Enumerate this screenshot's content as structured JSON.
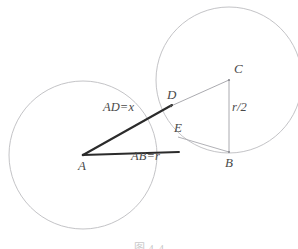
{
  "figure": {
    "caption": "图 4-4",
    "colors": {
      "circle_stroke": "#b9b9bd",
      "thin_line": "#9a9aa0",
      "thick_line": "#2a2a2a",
      "label_text": "#4a4a4a",
      "background": "#ffffff"
    },
    "circles": [
      {
        "name": "left-circle",
        "cx": 83,
        "cy": 155,
        "r": 74
      },
      {
        "name": "right-circle",
        "cx": 229,
        "cy": 80,
        "r": 73
      }
    ],
    "points": [
      {
        "id": "A",
        "label": "A",
        "x": 83,
        "y": 155,
        "label_x": 78,
        "label_y": 159
      },
      {
        "id": "B",
        "label": "B",
        "x": 229,
        "y": 152,
        "label_x": 225,
        "label_y": 156
      },
      {
        "id": "C",
        "label": "C",
        "x": 229,
        "y": 80,
        "label_x": 234,
        "label_y": 62
      },
      {
        "id": "D",
        "label": "D",
        "x": 171,
        "y": 106,
        "label_x": 167,
        "label_y": 88
      },
      {
        "id": "E",
        "label": "E",
        "x": 178,
        "y": 137,
        "label_x": 174,
        "label_y": 121
      }
    ],
    "segments": [
      {
        "name": "segment-AD",
        "from": "A",
        "to": "D",
        "style": "thick"
      },
      {
        "name": "segment-AE",
        "from": "A",
        "to": "E",
        "style": "thick"
      },
      {
        "name": "segment-DC",
        "from": "D",
        "to": "C",
        "style": "thin"
      },
      {
        "name": "segment-CB",
        "from": "C",
        "to": "B",
        "style": "thin"
      },
      {
        "name": "segment-EB",
        "from": "E",
        "to": "B",
        "style": "thin"
      }
    ],
    "annotations": [
      {
        "name": "label-AD",
        "text": "AD=x",
        "x": 103,
        "y": 101
      },
      {
        "name": "label-AB",
        "text": "AB=r",
        "x": 131,
        "y": 150
      },
      {
        "name": "label-r2",
        "text": "r/2",
        "x": 232,
        "y": 101
      }
    ]
  }
}
